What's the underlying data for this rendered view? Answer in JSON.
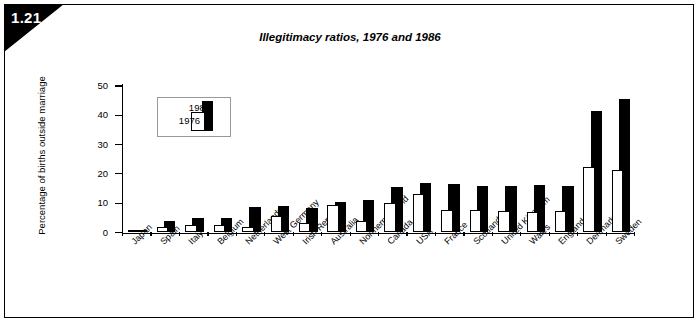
{
  "figure": {
    "badge_number": "1.21",
    "title": "Illegitimacy ratios, 1976 and 1986"
  },
  "legend": {
    "series_b_label": "1986",
    "series_a_label": "1976",
    "position": "upper-left-inside"
  },
  "axes": {
    "y_title": "Percentage of births outside marriage",
    "y_ticks": [
      "0",
      "10",
      "20",
      "30",
      "40",
      "50"
    ]
  },
  "chart_data": {
    "type": "bar",
    "title": "Illegitimacy ratios, 1976 and 1986",
    "xlabel": "",
    "ylabel": "Percentage of births outside marriage",
    "ylim": [
      0,
      50
    ],
    "ytick_step": 10,
    "grid": false,
    "legend_position": "upper left",
    "categories": [
      "Japan",
      "Spain",
      "Italy",
      "Belgium",
      "Netherlands",
      "West Germany",
      "Irish Republic",
      "Australia",
      "Northern Ireland",
      "Canada",
      "USA",
      "France",
      "Scotland",
      "United Kingdom",
      "Wales",
      "England",
      "Denmark",
      "Sweden"
    ],
    "series": [
      {
        "name": "1976",
        "color": "#ffffff",
        "values": [
          0.8,
          2.0,
          2.6,
          2.5,
          2.0,
          5.7,
          3.2,
          9.3,
          4.0,
          10.0,
          13.0,
          7.8,
          7.8,
          7.4,
          7.0,
          7.2,
          22.5,
          21.5
        ]
      },
      {
        "name": "1986",
        "color": "#000000",
        "values": [
          1.0,
          3.8,
          5.0,
          5.0,
          8.8,
          9.2,
          8.5,
          10.5,
          11.0,
          15.5,
          17.0,
          16.5,
          16.0,
          16.0,
          16.3,
          16.0,
          41.5,
          45.5
        ]
      }
    ]
  }
}
